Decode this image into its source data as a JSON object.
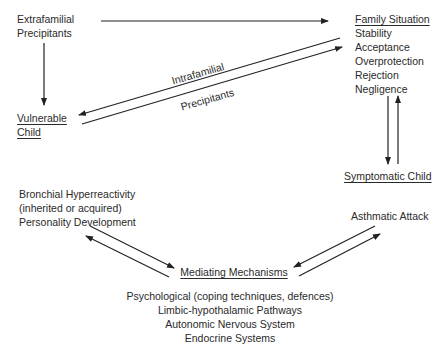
{
  "diagram": {
    "nodes": {
      "extrafamilial": {
        "lines": [
          "Extrafamilial",
          "Precipitants"
        ]
      },
      "family_situation": {
        "title": "Family Situation",
        "items": [
          "Stability",
          "Acceptance",
          "Overprotection",
          "Rejection",
          "Negligence"
        ]
      },
      "vulnerable_child": {
        "lines": [
          "Vulnerable",
          "Child"
        ]
      },
      "symptomatic_child": {
        "title": "Symptomatic Child"
      },
      "bronchial": {
        "lines": [
          "Bronchial Hyperreactivity",
          "(inherited or acquired)",
          "Personality Development"
        ]
      },
      "asthmatic_attack": {
        "label": "Asthmatic Attack"
      },
      "mediating": {
        "title": "Mediating Mechanisms",
        "items": [
          "Psychological (coping techniques, defences)",
          "Limbic-hypothalamic Pathways",
          "Autonomic Nervous System",
          "Endocrine Systems"
        ]
      }
    },
    "edge_labels": {
      "intrafamilial": "Intrafamilial",
      "precipitants": "Precipitants"
    },
    "line_color": "#222222"
  }
}
